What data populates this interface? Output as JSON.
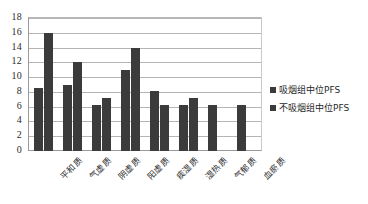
{
  "chart_data": {
    "type": "bar",
    "title": "",
    "subtitle": "",
    "xlabel": "",
    "ylabel": "",
    "ylim": [
      0,
      18
    ],
    "ytick_step": 2,
    "yticks": [
      "18",
      "16",
      "14",
      "12",
      "10",
      "8",
      "6",
      "4",
      "2",
      "0"
    ],
    "grid": true,
    "grid_axis": "y",
    "legend_position": "right",
    "bar_color": "#3b3b3b",
    "gridline_color": "#b5b5b5",
    "plot_background": "#ffffff",
    "axis_color": "#9a9a9a",
    "categories": [
      "平和质",
      "气虚质",
      "阴虚质",
      "阳虚质",
      "痰湿质",
      "湿热质",
      "气郁质",
      "血瘀质"
    ],
    "series": [
      {
        "name": "吸烟组中位PFS",
        "color": "#3b3b3b",
        "values": [
          8.5,
          9.0,
          6.2,
          11.0,
          8.1,
          6.2,
          6.2,
          6.2
        ]
      },
      {
        "name": "不吸烟组中位PFS",
        "color": "#3b3b3b",
        "values": [
          16.0,
          12.0,
          7.2,
          14.0,
          6.2,
          7.2,
          null,
          null
        ]
      }
    ]
  },
  "legend": {
    "entries": [
      {
        "label": "吸烟组中位PFS",
        "swatch": "legend-swatch-dark"
      },
      {
        "label": "不吸烟组中位PFS",
        "swatch": "legend-swatch-dark"
      }
    ]
  }
}
